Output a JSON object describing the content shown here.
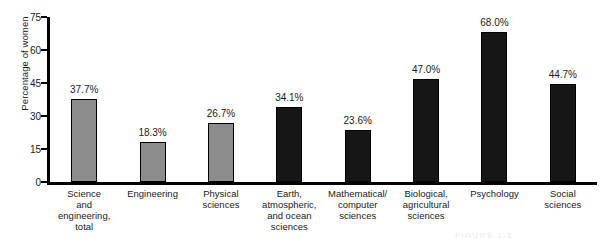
{
  "chart_data": {
    "type": "bar",
    "title": "",
    "xlabel": "",
    "ylabel": "Percentage of women",
    "ylim": [
      0,
      75
    ],
    "yticks": [
      0,
      15,
      30,
      45,
      60,
      75
    ],
    "grid": false,
    "legend": "none",
    "categories": [
      "Science\nand\nengineering,\ntotal",
      "Engineering",
      "Physical\nsciences",
      "Earth,\natmospheric,\nand ocean\nsciences",
      "Mathematical/\ncomputer\nsciences",
      "Biological,\nagricultural\nsciences",
      "Psychology",
      "Social\nsciences"
    ],
    "values": [
      37.7,
      18.3,
      26.7,
      34.1,
      23.6,
      47.0,
      68.0,
      44.7
    ],
    "value_labels": [
      "37.7%",
      "18.3%",
      "26.7%",
      "34.1%",
      "23.6%",
      "47.0%",
      "68.0%",
      "44.7%"
    ],
    "bar_colors": [
      "gray",
      "gray",
      "gray",
      "black",
      "black",
      "black",
      "black",
      "black"
    ],
    "colors": {
      "gray": "#8c8c8c",
      "black": "#161616",
      "axis": "#000000",
      "text": "#1a1a1a",
      "background": "#ffffff"
    }
  },
  "caption": {
    "text": "FIGURE 1-1"
  }
}
